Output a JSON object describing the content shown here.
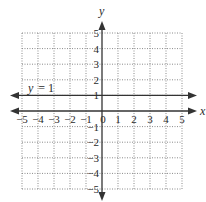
{
  "chart_data": {
    "type": "line",
    "title": "",
    "xlabel": "x",
    "ylabel": "y",
    "xlim": [
      -5,
      5
    ],
    "ylim": [
      -5,
      5
    ],
    "grid": true,
    "grid_style": "dotted",
    "x_ticks": [
      "-5",
      "-4",
      "-3",
      "-2",
      "-1",
      "0",
      "1",
      "2",
      "3",
      "4",
      "5"
    ],
    "y_ticks": [
      "5",
      "4",
      "3",
      "2",
      "1",
      "-1",
      "-2",
      "-3",
      "-4",
      "-5"
    ],
    "series": [
      {
        "name": "y = 1",
        "kind": "horizontal line",
        "equation": "y = 1",
        "x": [
          -5,
          5
        ],
        "y": [
          1,
          1
        ],
        "arrows_both_ends": true
      }
    ],
    "annotations": [
      {
        "text": "y = 1",
        "x": -4.5,
        "y": 1.4
      }
    ],
    "legend": "none"
  },
  "labels": {
    "x_axis": "x",
    "y_axis": "y",
    "origin": "0",
    "line_label_var": "y",
    "line_label_eq": "= 1"
  },
  "colors": {
    "axis": "#333333",
    "grid": "#8a8a8a",
    "line": "#333333",
    "text": "#2a2a2a",
    "background": "#ffffff"
  }
}
